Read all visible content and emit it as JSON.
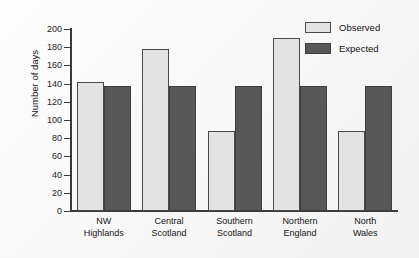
{
  "chart_data": {
    "type": "bar",
    "title": "",
    "xlabel": "",
    "ylabel": "Number of days",
    "ylim": [
      0,
      200
    ],
    "ytick_step": 20,
    "ytick_labels": [
      "200",
      "180",
      "160",
      "140",
      "120",
      "100",
      "80",
      "60",
      "40",
      "20",
      "0"
    ],
    "ytick_values": [
      200,
      180,
      160,
      140,
      120,
      100,
      80,
      60,
      40,
      20,
      0
    ],
    "grid": false,
    "legend_position": "top-right",
    "categories": [
      [
        "NW",
        "Highlands"
      ],
      [
        "Central",
        "Scotland"
      ],
      [
        "Southern",
        "Scotland"
      ],
      [
        "Northern",
        "England"
      ],
      [
        "North",
        "Wales"
      ]
    ],
    "category_labels": [
      "NW Highlands",
      "Central Scotland",
      "Southern Scotland",
      "Northern England",
      "North Wales"
    ],
    "series": [
      {
        "name": "Observed",
        "color": "#e3e3e3",
        "edge_color": "#4a4a4a",
        "values": [
          142,
          178,
          88,
          190,
          88
        ]
      },
      {
        "name": "Expected",
        "color": "#585858",
        "edge_color": "#3d3d3d",
        "values": [
          137,
          137,
          137,
          137,
          137
        ]
      }
    ]
  },
  "legend": {
    "entries": [
      {
        "label": "Observed",
        "swatch": "light-gray-swatch"
      },
      {
        "label": "Expected",
        "swatch": "dark-gray-swatch"
      }
    ]
  },
  "axis": {
    "y_title": "Number of days"
  }
}
